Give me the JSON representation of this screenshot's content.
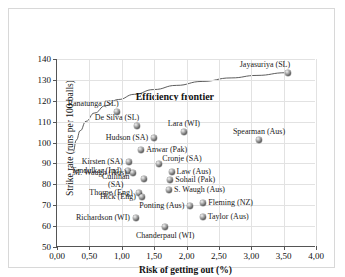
{
  "chart_data": {
    "type": "scatter",
    "title": "",
    "xlabel": "Risk of getting out (%)",
    "ylabel": "Strike rate (runs per 100 balls)",
    "xlim": [
      0,
      4
    ],
    "ylim": [
      50,
      140
    ],
    "xticks": [
      "0,00",
      "0,50",
      "1,00",
      "1,50",
      "2,00",
      "2,50",
      "3,00",
      "3,50",
      "4,00"
    ],
    "xtick_values": [
      0,
      0.5,
      1.0,
      1.5,
      2.0,
      2.5,
      3.0,
      3.5,
      4.0
    ],
    "yticks": [
      "50",
      "60",
      "70",
      "80",
      "90",
      "100",
      "110",
      "120",
      "130",
      "140"
    ],
    "ytick_values": [
      50,
      60,
      70,
      80,
      90,
      100,
      110,
      120,
      130,
      140
    ],
    "grid": true,
    "legend": "none",
    "annotations": [
      {
        "text": "Efficiency frontier",
        "x": 1.82,
        "y": 122.5
      }
    ],
    "curves": [
      {
        "name": "Efficiency frontier",
        "points": [
          [
            0.25,
            95.5
          ],
          [
            0.3,
            101.0
          ],
          [
            0.36,
            105.5
          ],
          [
            0.45,
            110.0
          ],
          [
            0.58,
            114.0
          ],
          [
            0.75,
            117.5
          ],
          [
            0.95,
            120.5
          ],
          [
            1.2,
            123.0
          ],
          [
            1.5,
            125.3
          ],
          [
            1.85,
            127.3
          ],
          [
            2.25,
            129.2
          ],
          [
            2.7,
            130.9
          ],
          [
            3.1,
            132.1
          ],
          [
            3.55,
            133.4
          ]
        ]
      }
    ],
    "points": [
      {
        "label": "Jayasuriya (SL)",
        "x": 3.57,
        "y": 133.4,
        "label_pos": "above-left"
      },
      {
        "label": "Ranatunga (SL)",
        "x": 0.92,
        "y": 114.7,
        "label_pos": "above-left"
      },
      {
        "label": "De Silva (SL)",
        "x": 1.24,
        "y": 107.7,
        "label_pos": "above-left"
      },
      {
        "label": "Lara (WI)",
        "x": 1.96,
        "y": 105.0,
        "label_pos": "above"
      },
      {
        "label": "Spearman (Aus)",
        "x": 3.12,
        "y": 101.2,
        "label_pos": "above"
      },
      {
        "label": "Hudson (SA)",
        "x": 1.5,
        "y": 102.0,
        "label_pos": "left"
      },
      {
        "label": "Anwar (Pak)",
        "x": 1.3,
        "y": 96.3,
        "label_pos": "right"
      },
      {
        "label": "Cronje (SA)",
        "x": 1.58,
        "y": 89.5,
        "label_pos": "right-above"
      },
      {
        "label": "Kirsten (SA)",
        "x": 1.11,
        "y": 90.5,
        "label_pos": "left"
      },
      {
        "label": "Tendulkar (Ind)",
        "x": 1.09,
        "y": 86.3,
        "label_pos": "left"
      },
      {
        "label": "Law (Aus)",
        "x": 1.77,
        "y": 86.0,
        "label_pos": "right"
      },
      {
        "label": "M. Waugh (Aus)",
        "x": 1.17,
        "y": 85.4,
        "label_pos": "left"
      },
      {
        "label": "Sohail (Pak)",
        "x": 1.75,
        "y": 82.3,
        "label_pos": "right"
      },
      {
        "label": "Cullinan (SA)",
        "x": 1.34,
        "y": 82.6,
        "label_pos": "left-two"
      },
      {
        "label": "S. Waugh (Aus)",
        "x": 1.73,
        "y": 77.5,
        "label_pos": "right"
      },
      {
        "label": "Thorpe (Eng)",
        "x": 1.26,
        "y": 76.0,
        "label_pos": "left"
      },
      {
        "label": "Hick (Eng)",
        "x": 1.31,
        "y": 73.7,
        "label_pos": "left"
      },
      {
        "label": "Fleming (NZ)",
        "x": 2.26,
        "y": 71.2,
        "label_pos": "right"
      },
      {
        "label": "Ponting (Aus)",
        "x": 2.06,
        "y": 69.6,
        "label_pos": "left"
      },
      {
        "label": "Taylor (Aus)",
        "x": 2.25,
        "y": 64.5,
        "label_pos": "right"
      },
      {
        "label": "Richardson (WI)",
        "x": 1.22,
        "y": 63.7,
        "label_pos": "left"
      },
      {
        "label": "Chanderpaul (WI)",
        "x": 1.67,
        "y": 59.8,
        "label_pos": "below"
      }
    ]
  }
}
